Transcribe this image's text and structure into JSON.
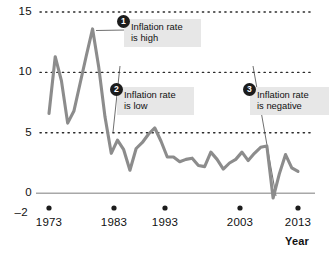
{
  "chart_data": {
    "type": "line",
    "title": "",
    "xlabel": "Year",
    "ylabel": "",
    "xlim": [
      1973,
      2013
    ],
    "ylim": [
      -2,
      15
    ],
    "grid": "horizontal-dotted",
    "gridlines": [
      5,
      10,
      15
    ],
    "zero_line": 0,
    "legend": "none",
    "y_ticks": [
      "15",
      "10",
      "5",
      "0",
      "–2"
    ],
    "y_tick_values": [
      15,
      10,
      5,
      0,
      -2
    ],
    "x_ticks": [
      "1973",
      "1983",
      "1993",
      "2003",
      "2013"
    ],
    "x_tick_values": [
      1973,
      1983,
      1993,
      2003,
      2013
    ],
    "series_color": "#8c8c8c",
    "x": [
      1973,
      1974,
      1975,
      1976,
      1977,
      1978,
      1979,
      1980,
      1981,
      1982,
      1983,
      1984,
      1985,
      1986,
      1987,
      1988,
      1989,
      1990,
      1991,
      1992,
      1993,
      1994,
      1995,
      1996,
      1997,
      1998,
      1999,
      2000,
      2001,
      2002,
      2003,
      2004,
      2005,
      2006,
      2007,
      2008,
      2009,
      2010,
      2011,
      2012,
      2013
    ],
    "values": [
      6.6,
      11.3,
      9.3,
      5.8,
      6.8,
      9.1,
      11.4,
      13.6,
      10.4,
      6.3,
      3.3,
      4.4,
      3.6,
      1.9,
      3.7,
      4.2,
      4.9,
      5.4,
      4.3,
      3.0,
      3.0,
      2.6,
      2.8,
      2.9,
      2.3,
      2.2,
      3.4,
      2.8,
      2.0,
      2.5,
      2.8,
      3.4,
      2.7,
      3.3,
      3.8,
      3.9,
      -0.4,
      1.6,
      3.2,
      2.1,
      1.8
    ],
    "annotations": [
      {
        "badge": "1",
        "text": "Inflation rate\nis high",
        "points_to_year": 1980,
        "points_to_value": 13.6
      },
      {
        "badge": "2",
        "text": "Inflation rate\nis low",
        "points_to_year": 1986,
        "points_to_value": 1.9
      },
      {
        "badge": "3",
        "text": "Inflation rate\nis negative",
        "points_to_year": 2009,
        "points_to_value": -0.4
      }
    ]
  }
}
